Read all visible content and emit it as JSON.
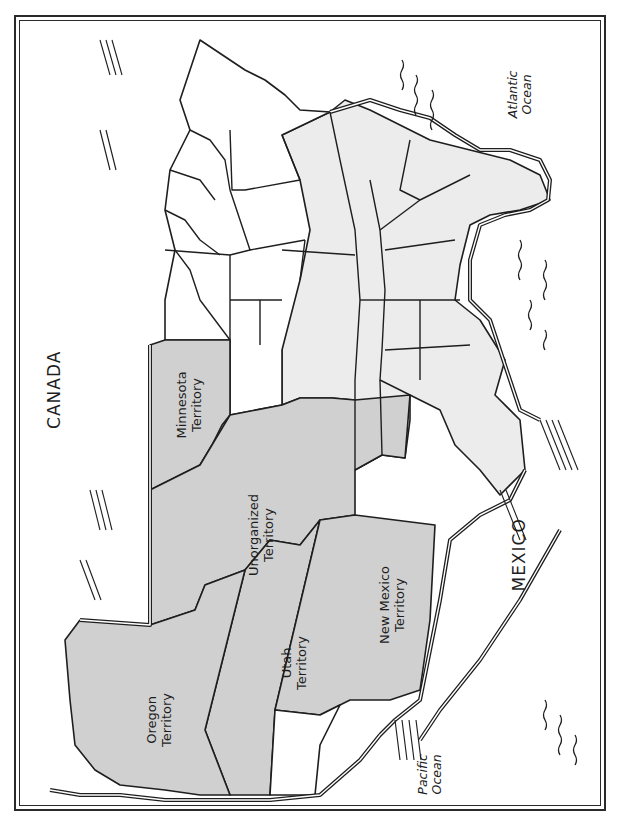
{
  "map": {
    "orientation": "rotated 90 degrees counter-clockwise (north faces left)",
    "colors": {
      "free_states": "#ffffff",
      "slave_states": "#ececec",
      "territories": "#d0d0d0",
      "outline": "#1e1e1e",
      "frame": "#2a2a2a"
    },
    "labels": {
      "canada": "CANADA",
      "mexico": "MEXICO",
      "atlantic": [
        "Atlantic",
        "Ocean"
      ],
      "pacific": [
        "Pacific",
        "Ocean"
      ],
      "minnesota": [
        "Minnesota",
        "Territory"
      ],
      "unorganized": [
        "Unorganized",
        "Territory"
      ],
      "utah": [
        "Utah",
        "Territory"
      ],
      "new_mexico": [
        "New Mexico",
        "Territory"
      ],
      "oregon": [
        "Oregon",
        "Territory"
      ]
    }
  }
}
